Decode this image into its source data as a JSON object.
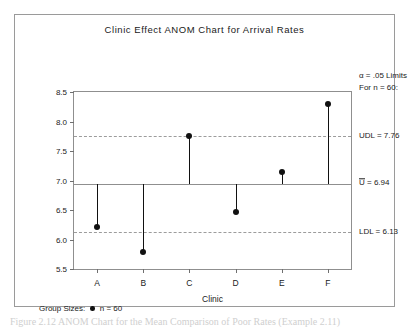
{
  "chart_data": {
    "type": "scatter",
    "title": "Clinic Effect ANOM Chart for Arrival Rates",
    "xlabel": "Clinic",
    "ylabel": "Arrival Rate / 60 Hours",
    "categories": [
      "A",
      "B",
      "C",
      "D",
      "E",
      "F"
    ],
    "values": [
      6.21,
      5.79,
      7.76,
      6.46,
      7.15,
      8.3
    ],
    "ylim": [
      5.5,
      8.5
    ],
    "yticks": [
      "5.5",
      "6.0",
      "6.5",
      "7.0",
      "7.5",
      "8.0",
      "8.5"
    ],
    "ytick_values": [
      5.5,
      6.0,
      6.5,
      7.0,
      7.5,
      8.0,
      8.5
    ],
    "grid": false,
    "legend_position": "bottom-left",
    "reference_lines": [
      {
        "name": "UDL",
        "label": "UDL = 7.76",
        "value": 7.76,
        "style": "dashed"
      },
      {
        "name": "center",
        "label": "U = 6.94",
        "value": 6.94,
        "style": "solid"
      },
      {
        "name": "LDL",
        "label": "LDL = 6.13",
        "value": 6.13,
        "style": "dashed"
      }
    ],
    "annotations": {
      "alpha_line1": "α = .05  Limits",
      "alpha_line2": "For n = 60:"
    },
    "legend": {
      "title": "Group Sizes:",
      "entry": "n = 60"
    }
  },
  "limit_labels": {
    "udl": "UDL = 7.76",
    "center_symbol": "U",
    "center_value": " = 6.94",
    "ldl": "LDL = 6.13"
  },
  "caption": {
    "text": "Figure 2.12  ANOM Chart for the Mean Comparison of Poor Rates (Example 2.11)"
  },
  "colors": {
    "frame": "#9a9a9a",
    "axis": "#8f8f8f",
    "data": "#111111",
    "limit_line": "#9c9c9c",
    "text": "#1a1a1a"
  }
}
